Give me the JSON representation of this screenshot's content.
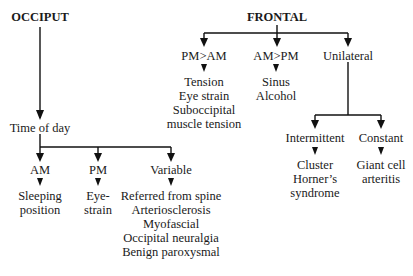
{
  "diagram": {
    "occiput": {
      "title": "OCCIPUT",
      "time_node": "Time of day",
      "branches": [
        {
          "label": "AM",
          "items": [
            "Sleeping",
            "position"
          ]
        },
        {
          "label": "PM",
          "items": [
            "Eye-",
            "strain"
          ]
        },
        {
          "label": "Variable",
          "items": [
            "Referred from spine",
            "Arteriosclerosis",
            "Myofascial",
            "Occipital neuralgia",
            "Benign paroxysmal"
          ]
        }
      ]
    },
    "frontal": {
      "title": "FRONTAL",
      "branches": [
        {
          "label": "PM>AM",
          "items": [
            "Tension",
            "Eye strain",
            "Suboccipital",
            "muscle tension"
          ]
        },
        {
          "label": "AM>PM",
          "items": [
            "Sinus",
            "Alcohol"
          ]
        },
        {
          "label": "Unilateral"
        }
      ],
      "unilateral_branches": [
        {
          "label": "Intermittent",
          "items": [
            "Cluster",
            "Horner’s",
            "syndrome"
          ]
        },
        {
          "label": "Constant",
          "items": [
            "Giant cell",
            "arteritis"
          ]
        }
      ]
    }
  }
}
